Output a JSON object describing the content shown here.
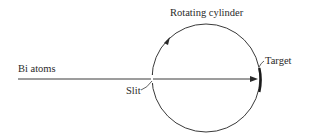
{
  "diagram": {
    "labels": {
      "beam": "Bi atoms",
      "slit": "Slit",
      "cylinder": "Rotating cylinder",
      "target": "Target"
    },
    "colors": {
      "line": "#3a3a3a",
      "text": "#2a2a2a",
      "target": "#1a1a1a",
      "background": "#ffffff"
    }
  }
}
